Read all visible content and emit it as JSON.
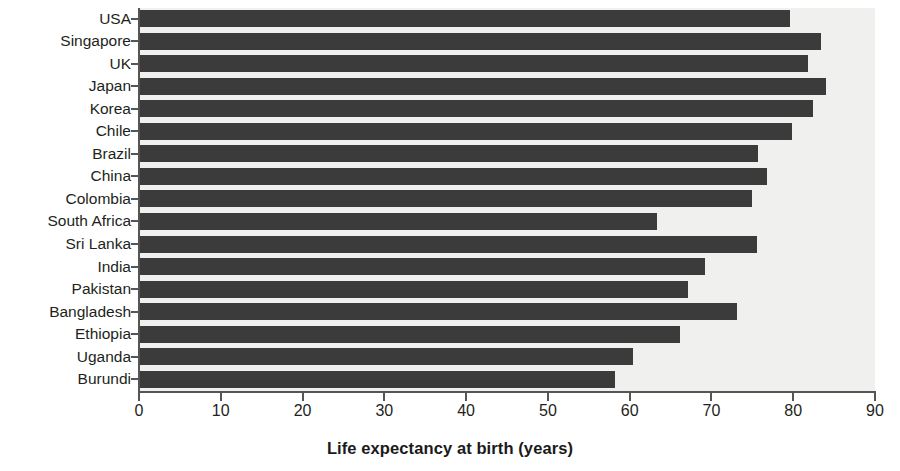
{
  "chart_data": {
    "type": "bar",
    "orientation": "horizontal",
    "title": "",
    "xlabel": "Life expectancy at birth (years)",
    "ylabel": "",
    "xlim": [
      0,
      90
    ],
    "xticks": [
      0,
      10,
      20,
      30,
      40,
      50,
      60,
      70,
      80,
      90
    ],
    "xtick_labels": [
      "0",
      "10",
      "20",
      "30",
      "40",
      "50",
      "60",
      "70",
      "80",
      "90"
    ],
    "grid": false,
    "legend": null,
    "bar_color": "#3b3b3b",
    "plot_background": "#f0f0ee",
    "axis_color": "#555555",
    "categories": [
      "USA",
      "Singapore",
      "UK",
      "Japan",
      "Korea",
      "Chile",
      "Brazil",
      "China",
      "Colombia",
      "South Africa",
      "Sri Lanka",
      "India",
      "Pakistan",
      "Bangladesh",
      "Ethiopia",
      "Uganda",
      "Burundi"
    ],
    "values": [
      79.6,
      83.4,
      81.8,
      84.0,
      82.4,
      79.9,
      75.7,
      76.8,
      74.9,
      63.4,
      75.6,
      69.2,
      67.1,
      73.1,
      66.2,
      60.4,
      58.2
    ]
  }
}
